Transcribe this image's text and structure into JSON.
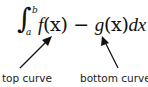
{
  "formula": {
    "integral_symbol": "∫",
    "lower_limit": "a",
    "upper_limit": "b",
    "f": "f",
    "f_arg": "(x)",
    "minus": " − ",
    "g": "g",
    "g_arg": "(x)",
    "d": "d",
    "x": "x"
  },
  "annotations": [
    {
      "label": "top curve",
      "points_to": "f(x)"
    },
    {
      "label": "bottom curve",
      "points_to": "g(x)"
    }
  ],
  "colors": {
    "text": "#111111",
    "arrow": "#111111",
    "background": "#ffffff"
  }
}
